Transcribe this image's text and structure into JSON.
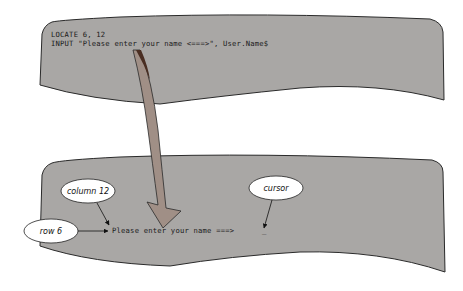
{
  "colors": {
    "panel_fill": "#a9a7a5",
    "panel_stroke": "#2a2a2a",
    "arrow_fill": "#a08f86",
    "arrow_dark": "#4a2e22",
    "callout_fill": "#ffffff",
    "background": "#ffffff"
  },
  "code_panel": {
    "lines": [
      "LOCATE 6, 12",
      "INPUT \"Please enter your name <===>\", User.Name$"
    ]
  },
  "screen_panel": {
    "output_text": "Please enter your name ===>",
    "cursor_glyph": "_"
  },
  "callouts": {
    "column": "column 12",
    "row": "row 6",
    "cursor": "cursor"
  }
}
